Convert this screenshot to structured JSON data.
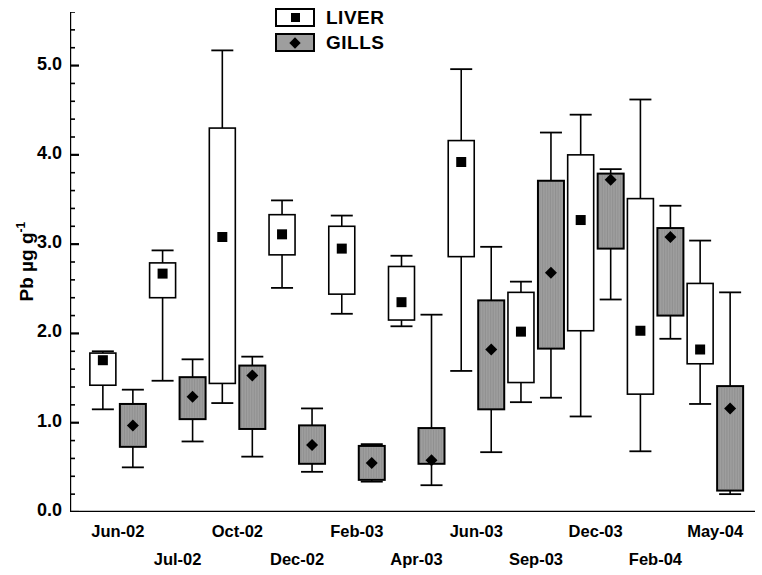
{
  "chart_data": {
    "type": "box",
    "title": "",
    "xlabel": "",
    "ylabel": "Pb µg g-1",
    "ylabel_text": "Pb µg g",
    "ylabel_sup": "-1",
    "ylim": [
      0.0,
      5.6
    ],
    "ytick_labels": [
      "0.0",
      "1.0",
      "2.0",
      "3.0",
      "4.0",
      "5.0"
    ],
    "ytick_values": [
      0.0,
      1.0,
      2.0,
      3.0,
      4.0,
      5.0
    ],
    "minor_ticks_per_interval": 4,
    "grid": false,
    "legend": {
      "position": "top-center",
      "entries": [
        {
          "name": "LIVER",
          "fill": "#ffffff",
          "marker": "square"
        },
        {
          "name": "GILLS",
          "fill": "#9e9e9e",
          "marker": "diamond"
        }
      ]
    },
    "categories": [
      "Jun-02",
      "Jul-02",
      "Oct-02",
      "Dec-02",
      "Feb-03",
      "Apr-03",
      "Jun-03",
      "Sep-03",
      "Dec-03",
      "Feb-04",
      "May-04"
    ],
    "category_rows": [
      0,
      1,
      0,
      1,
      0,
      1,
      0,
      1,
      0,
      1,
      0
    ],
    "series": [
      {
        "name": "LIVER",
        "fill": "#ffffff",
        "marker": "square",
        "boxes": [
          {
            "category": "Jun-02",
            "whisker_low": 1.15,
            "q1": 1.42,
            "mean": 1.7,
            "q3": 1.78,
            "whisker_high": 1.8
          },
          {
            "category": "Jul-02",
            "whisker_low": 1.47,
            "q1": 2.4,
            "mean": 2.67,
            "q3": 2.79,
            "whisker_high": 2.93
          },
          {
            "category": "Oct-02",
            "whisker_low": 1.22,
            "q1": 1.44,
            "mean": 3.08,
            "q3": 4.3,
            "whisker_high": 5.17
          },
          {
            "category": "Dec-02",
            "whisker_low": 2.51,
            "q1": 2.88,
            "mean": 3.11,
            "q3": 3.33,
            "whisker_high": 3.49
          },
          {
            "category": "Feb-03",
            "whisker_low": 2.22,
            "q1": 2.44,
            "mean": 2.95,
            "q3": 3.2,
            "whisker_high": 3.32
          },
          {
            "category": "Apr-03",
            "whisker_low": 2.08,
            "q1": 2.15,
            "mean": 2.35,
            "q3": 2.75,
            "whisker_high": 2.87
          },
          {
            "category": "Jun-03",
            "whisker_low": 1.58,
            "q1": 2.86,
            "mean": 3.92,
            "q3": 4.16,
            "whisker_high": 4.96
          },
          {
            "category": "Sep-03",
            "whisker_low": 1.23,
            "q1": 1.45,
            "mean": 2.02,
            "q3": 2.46,
            "whisker_high": 2.58
          },
          {
            "category": "Dec-03",
            "whisker_low": 1.07,
            "q1": 2.03,
            "mean": 3.27,
            "q3": 4.0,
            "whisker_high": 4.45
          },
          {
            "category": "Feb-04",
            "whisker_low": 0.68,
            "q1": 1.32,
            "mean": 2.03,
            "q3": 3.51,
            "whisker_high": 4.62
          },
          {
            "category": "May-04",
            "whisker_low": 1.21,
            "q1": 1.66,
            "mean": 1.82,
            "q3": 2.56,
            "whisker_high": 3.04
          }
        ]
      },
      {
        "name": "GILLS",
        "fill": "#9e9e9e",
        "marker": "diamond",
        "boxes": [
          {
            "category": "Jun-02",
            "whisker_low": 0.5,
            "q1": 0.73,
            "mean": 0.97,
            "q3": 1.21,
            "whisker_high": 1.37
          },
          {
            "category": "Jul-02",
            "whisker_low": 0.79,
            "q1": 1.04,
            "mean": 1.29,
            "q3": 1.51,
            "whisker_high": 1.71
          },
          {
            "category": "Oct-02",
            "whisker_low": 0.62,
            "q1": 0.93,
            "mean": 1.53,
            "q3": 1.64,
            "whisker_high": 1.74
          },
          {
            "category": "Dec-02",
            "whisker_low": 0.45,
            "q1": 0.54,
            "mean": 0.75,
            "q3": 0.97,
            "whisker_high": 1.16
          },
          {
            "category": "Feb-03",
            "whisker_low": 0.34,
            "q1": 0.36,
            "mean": 0.55,
            "q3": 0.74,
            "whisker_high": 0.76
          },
          {
            "category": "Apr-03",
            "whisker_low": 0.3,
            "q1": 0.54,
            "mean": 0.58,
            "q3": 0.94,
            "whisker_high": 2.21
          },
          {
            "category": "Jun-03",
            "whisker_low": 0.67,
            "q1": 1.15,
            "mean": 1.82,
            "q3": 2.37,
            "whisker_high": 2.97
          },
          {
            "category": "Sep-03",
            "whisker_low": 1.28,
            "q1": 1.83,
            "mean": 2.68,
            "q3": 3.71,
            "whisker_high": 4.25
          },
          {
            "category": "Dec-03",
            "whisker_low": 2.38,
            "q1": 2.95,
            "mean": 3.72,
            "q3": 3.79,
            "whisker_high": 3.84
          },
          {
            "category": "Feb-04",
            "whisker_low": 1.94,
            "q1": 2.2,
            "mean": 3.08,
            "q3": 3.18,
            "whisker_high": 3.43
          },
          {
            "category": "May-04",
            "whisker_low": 0.2,
            "q1": 0.24,
            "mean": 1.16,
            "q3": 1.41,
            "whisker_high": 2.46
          }
        ]
      }
    ]
  }
}
